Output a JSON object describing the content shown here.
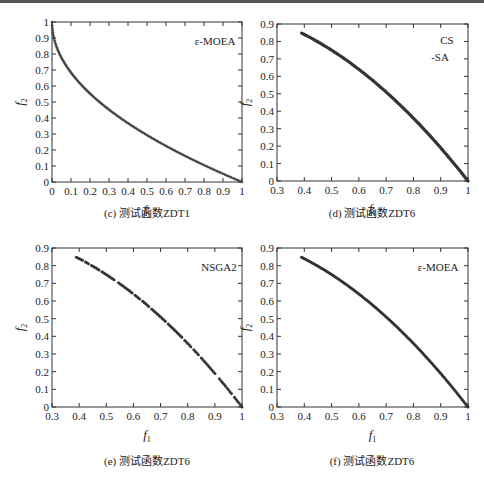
{
  "chart_data": [
    {
      "id": "c",
      "type": "scatter",
      "caption": "(c) 测试函数ZDT1",
      "legend": "ε-MOEA",
      "xlabel": "f1",
      "ylabel": "f2",
      "xlim": [
        0,
        1
      ],
      "ylim": [
        0,
        1
      ],
      "xticks": [
        0,
        0.1,
        0.2,
        0.3,
        0.4,
        0.5,
        0.6,
        0.7,
        0.8,
        0.9,
        1
      ],
      "yticks": [
        0,
        0.1,
        0.2,
        0.3,
        0.4,
        0.5,
        0.6,
        0.7,
        0.8,
        0.9,
        1
      ],
      "grid": false,
      "curve": "f2 = 1 - sqrt(f1)",
      "x": [
        0.0,
        0.01,
        0.02,
        0.05,
        0.1,
        0.15,
        0.2,
        0.3,
        0.4,
        0.5,
        0.6,
        0.7,
        0.8,
        0.9,
        1.0
      ],
      "y": [
        1.0,
        0.9,
        0.86,
        0.78,
        0.68,
        0.61,
        0.55,
        0.45,
        0.37,
        0.29,
        0.23,
        0.16,
        0.11,
        0.05,
        0.0
      ],
      "marker": "dense-plus",
      "frame": {
        "left": 52,
        "top": 22,
        "right": 242,
        "bottom": 182
      },
      "legend_pos": {
        "x": 215,
        "y": 45
      },
      "caption_pos": {
        "x": 147,
        "y": 217
      }
    },
    {
      "id": "d",
      "type": "scatter",
      "caption": "(d) 测试函数ZDT6",
      "legend": "CS",
      "legend2": "-SA",
      "xlabel": "f1",
      "ylabel": "f2",
      "xlim": [
        0.3,
        1
      ],
      "ylim": [
        0,
        0.9
      ],
      "xticks": [
        0.3,
        0.4,
        0.5,
        0.6,
        0.7,
        0.8,
        0.9,
        1
      ],
      "yticks": [
        0,
        0.1,
        0.2,
        0.3,
        0.4,
        0.5,
        0.6,
        0.7,
        0.8,
        0.9
      ],
      "grid": false,
      "curve": "f2 = 1 - f1^2",
      "x": [
        0.39,
        0.45,
        0.5,
        0.55,
        0.6,
        0.65,
        0.7,
        0.75,
        0.8,
        0.85,
        0.9,
        0.95,
        1.0
      ],
      "y": [
        0.85,
        0.8,
        0.75,
        0.7,
        0.64,
        0.58,
        0.51,
        0.44,
        0.36,
        0.28,
        0.19,
        0.1,
        0.0
      ],
      "marker": "thick-line",
      "frame": {
        "left": 277,
        "top": 24,
        "right": 468,
        "bottom": 181
      },
      "legend_pos": {
        "x": 447,
        "y": 44
      },
      "legend2_pos": {
        "x": 440,
        "y": 61
      },
      "caption_pos": {
        "x": 372,
        "y": 217
      }
    },
    {
      "id": "e",
      "type": "scatter",
      "caption": "(e) 测试函数ZDT6",
      "legend": "NSGA2",
      "xlabel": "f1",
      "ylabel": "f2",
      "xlim": [
        0.3,
        1
      ],
      "ylim": [
        0,
        0.9
      ],
      "xticks": [
        0.3,
        0.4,
        0.5,
        0.6,
        0.7,
        0.8,
        0.9,
        1
      ],
      "yticks": [
        0,
        0.1,
        0.2,
        0.3,
        0.4,
        0.5,
        0.6,
        0.7,
        0.8,
        0.9
      ],
      "grid": false,
      "curve": "f2 = 1 - f1^2 (sparse, gapped)",
      "x": [
        0.39,
        0.45,
        0.5,
        0.55,
        0.6,
        0.65,
        0.7,
        0.75,
        0.8,
        0.85,
        0.9,
        0.95,
        1.0
      ],
      "y": [
        0.85,
        0.8,
        0.75,
        0.7,
        0.64,
        0.58,
        0.51,
        0.44,
        0.36,
        0.28,
        0.19,
        0.1,
        0.02
      ],
      "marker": "sparse-dots",
      "frame": {
        "left": 52,
        "top": 248,
        "right": 242,
        "bottom": 407
      },
      "legend_pos": {
        "x": 219,
        "y": 271
      },
      "caption_pos": {
        "x": 147,
        "y": 465
      }
    },
    {
      "id": "f",
      "type": "scatter",
      "caption": "(f) 测试函数ZDT6",
      "legend": "ε-MOEA",
      "xlabel": "f1",
      "ylabel": "f2",
      "xlim": [
        0.3,
        1
      ],
      "ylim": [
        0,
        0.9
      ],
      "xticks": [
        0.3,
        0.4,
        0.5,
        0.6,
        0.7,
        0.8,
        0.9,
        1
      ],
      "yticks": [
        0,
        0.1,
        0.2,
        0.3,
        0.4,
        0.5,
        0.6,
        0.7,
        0.8,
        0.9
      ],
      "grid": false,
      "curve": "f2 = 1 - f1^2",
      "x": [
        0.39,
        0.45,
        0.5,
        0.55,
        0.6,
        0.65,
        0.7,
        0.75,
        0.8,
        0.85,
        0.9,
        0.95,
        1.0
      ],
      "y": [
        0.85,
        0.8,
        0.75,
        0.7,
        0.64,
        0.58,
        0.51,
        0.44,
        0.36,
        0.28,
        0.19,
        0.1,
        0.0
      ],
      "marker": "dense-dots",
      "frame": {
        "left": 277,
        "top": 248,
        "right": 468,
        "bottom": 407
      },
      "legend_pos": {
        "x": 438,
        "y": 271
      },
      "caption_pos": {
        "x": 372,
        "y": 465
      }
    }
  ]
}
